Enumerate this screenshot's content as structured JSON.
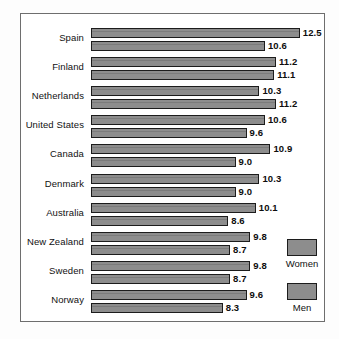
{
  "chart_data": {
    "type": "bar",
    "orientation": "horizontal",
    "title": "",
    "subtitle": "",
    "xlabel": "",
    "ylabel": "",
    "grid": false,
    "legend_position": "right-bottom",
    "xlim": [
      0,
      13
    ],
    "categories": [
      "Spain",
      "Finland",
      "Netherlands",
      "United States",
      "Canada",
      "Denmark",
      "Australia",
      "New Zealand",
      "Sweden",
      "Norway"
    ],
    "series": [
      {
        "name": "Women",
        "values": [
          12.5,
          11.2,
          10.3,
          10.6,
          10.9,
          10.3,
          10.1,
          9.8,
          9.8,
          9.6
        ]
      },
      {
        "name": "Men",
        "values": [
          10.6,
          11.1,
          11.2,
          9.6,
          9.0,
          9.0,
          8.6,
          8.7,
          8.7,
          8.3
        ]
      }
    ],
    "data_labels": {
      "Spain": {
        "Women": "12.5",
        "Men": "10.6"
      },
      "Finland": {
        "Women": "11.2",
        "Men": "11.1"
      },
      "Netherlands": {
        "Women": "10.3",
        "Men": "11.2"
      },
      "United States": {
        "Women": "10.6",
        "Men": "9.6"
      },
      "Canada": {
        "Women": "10.9",
        "Men": "9.0"
      },
      "Denmark": {
        "Women": "10.3",
        "Men": "9.0"
      },
      "Australia": {
        "Women": "10.1",
        "Men": "8.6"
      },
      "New Zealand": {
        "Women": "9.8",
        "Men": "8.7"
      },
      "Sweden": {
        "Women": "9.8",
        "Men": "8.7"
      },
      "Norway": {
        "Women": "9.6",
        "Men": "8.3"
      }
    }
  },
  "legend": {
    "items": [
      {
        "label": "Women",
        "color": "#8d8d8d"
      },
      {
        "label": "Men",
        "color": "#8d8d8d"
      }
    ]
  },
  "style": {
    "bar_fill": "#8d8d8d",
    "bar_border": "#1c1c1c",
    "panel_border": "#6e6e6e",
    "text_color": "#111111",
    "background": "#ffffff"
  }
}
